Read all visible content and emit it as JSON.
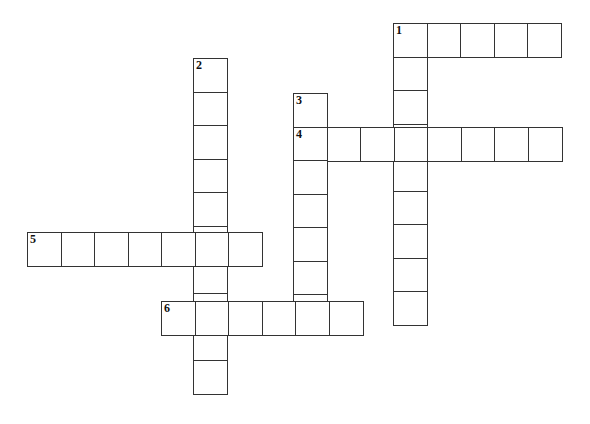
{
  "puzzle": {
    "type": "crossword",
    "cell_size": 33.5,
    "words": [
      {
        "number": "1",
        "direction": "across",
        "x": 393,
        "y": 23,
        "length": 5
      },
      {
        "number": "1",
        "direction": "down",
        "x": 393,
        "y": 23,
        "length": 9
      },
      {
        "number": "2",
        "direction": "down",
        "x": 193,
        "y": 58,
        "length": 10
      },
      {
        "number": "3",
        "direction": "down",
        "x": 293,
        "y": 93,
        "length": 7
      },
      {
        "number": "4",
        "direction": "across",
        "x": 293,
        "y": 127,
        "length": 8
      },
      {
        "number": "5",
        "direction": "across",
        "x": 27,
        "y": 232,
        "length": 7
      },
      {
        "number": "6",
        "direction": "across",
        "x": 161,
        "y": 301,
        "length": 6
      }
    ],
    "clue_numbers": [
      {
        "label": "1",
        "x": 393,
        "y": 23
      },
      {
        "label": "2",
        "x": 193,
        "y": 58
      },
      {
        "label": "3",
        "x": 293,
        "y": 93
      },
      {
        "label": "4",
        "x": 293,
        "y": 127
      },
      {
        "label": "5",
        "x": 27,
        "y": 232
      },
      {
        "label": "6",
        "x": 161,
        "y": 301
      }
    ]
  }
}
